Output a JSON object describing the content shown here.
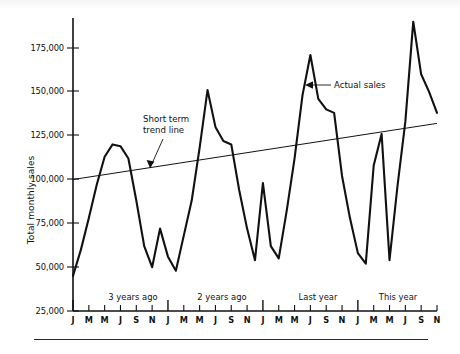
{
  "chart_data": {
    "type": "line",
    "title": "",
    "xlabel": "",
    "ylabel": "Total monthly sales",
    "ylim": [
      25000,
      187500
    ],
    "yticks": [
      25000,
      50000,
      75000,
      100000,
      125000,
      150000,
      175000
    ],
    "ytick_labels": [
      "25,000",
      "50,000",
      "75,000",
      "100,000",
      "125,000",
      "150,000",
      "175,000"
    ],
    "grid": false,
    "legend_position": "none",
    "x_month_labels": [
      "J",
      "M",
      "M",
      "J",
      "S",
      "N"
    ],
    "period_labels": [
      "3 years ago",
      "2 years ago",
      "Last year",
      "This year"
    ],
    "x_start_label": "J",
    "x_end_label": "J",
    "annotations": [
      {
        "text": "Short term trend line",
        "target": "trend-line",
        "arrow": "down-left"
      },
      {
        "text": "Actual sales",
        "target": "series-line",
        "arrow": "left"
      }
    ],
    "series": [
      {
        "name": "Actual sales",
        "values": [
          45000,
          60000,
          78000,
          97000,
          113000,
          120000,
          119000,
          112000,
          88000,
          62000,
          50000,
          72000,
          56000,
          48000,
          68000,
          88000,
          118000,
          151000,
          130000,
          122000,
          120000,
          94000,
          72000,
          54000,
          98000,
          62000,
          55000,
          82000,
          112000,
          148000,
          171000,
          146000,
          140000,
          138000,
          102000,
          78000,
          58000,
          52000,
          108000,
          126000,
          54000,
          96000,
          133000,
          190000,
          160000,
          150000,
          138000
        ]
      },
      {
        "name": "Short term trend line",
        "type": "trend",
        "start_value": 100000,
        "end_value": 132000
      }
    ]
  },
  "axis": {
    "y_title": "Total monthly sales"
  }
}
